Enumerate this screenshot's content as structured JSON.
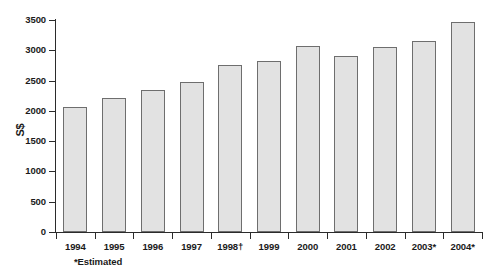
{
  "chart_data": {
    "type": "bar",
    "title": "",
    "subtitle": "",
    "xlabel": "",
    "ylabel": "S$",
    "categories": [
      "1994",
      "1995",
      "1996",
      "1997",
      "1998†",
      "1999",
      "2000",
      "2001",
      "2002",
      "2003*",
      "2004*"
    ],
    "values": [
      2070,
      2215,
      2340,
      2480,
      2760,
      2820,
      3075,
      2900,
      3050,
      3150,
      3470
    ],
    "ylim": [
      0,
      3500
    ],
    "y_ticks": [
      0,
      500,
      1000,
      1500,
      2000,
      2500,
      3000,
      3500
    ],
    "y_tick_labels": [
      "0",
      "500",
      "1000",
      "1500",
      "2000",
      "2500",
      "3000",
      "3500"
    ],
    "grid": false,
    "legend": null,
    "legend_position": "none",
    "annotations": [
      "*Estimated"
    ],
    "bar_fill_color": "#e2e2e2",
    "bar_border_color": "#6e6e6e",
    "axis_color": "#2b2b2b",
    "text_color": "#1a1a1a",
    "background_color": "#ffffff"
  },
  "footnote": "*Estimated",
  "axis": {
    "y_title": "S$"
  }
}
